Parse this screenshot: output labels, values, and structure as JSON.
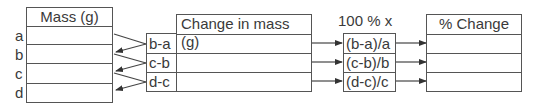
{
  "mass_table": {
    "header": "Mass (g)",
    "row_labels": [
      "a",
      "b",
      "c",
      "d"
    ],
    "values": [
      "",
      "",
      "",
      ""
    ]
  },
  "difference_labels": [
    "b-a",
    "c-b",
    "d-c"
  ],
  "change_table": {
    "header": "Change in mass (g)",
    "values": [
      "",
      "",
      ""
    ]
  },
  "formula": {
    "header": "100 % x",
    "items": [
      "(b-a)/a",
      "(c-b)/b",
      "(d-c)/c"
    ]
  },
  "percent_table": {
    "header": "% Change",
    "values": [
      "",
      "",
      ""
    ]
  },
  "colors": {
    "line": "#555555",
    "text": "#3a3a3a"
  }
}
